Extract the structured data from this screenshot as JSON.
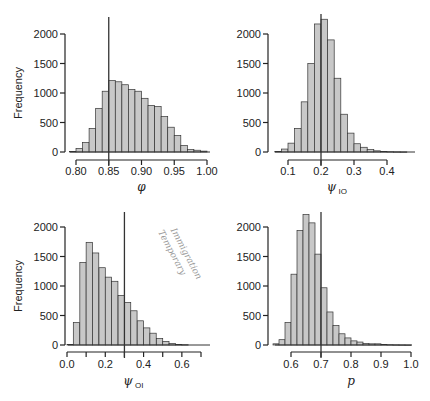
{
  "chart_data": [
    {
      "type": "bar",
      "title": "",
      "xlabel": "φ",
      "ylabel": "Frequency",
      "ylim": [
        0,
        2000
      ],
      "yticks": [
        "0",
        "500",
        "1000",
        "1500",
        "2000"
      ],
      "xticks": [
        "0.80",
        "0.85",
        "0.90",
        "0.95",
        "1.00"
      ],
      "xlim": [
        0.8,
        1.0
      ],
      "bin_width": 0.01,
      "bin_starts": [
        0.79,
        0.8,
        0.81,
        0.82,
        0.83,
        0.84,
        0.85,
        0.86,
        0.87,
        0.88,
        0.89,
        0.9,
        0.91,
        0.92,
        0.93,
        0.94,
        0.95,
        0.96,
        0.97,
        0.98,
        0.99
      ],
      "values": [
        10,
        60,
        160,
        400,
        740,
        1030,
        1210,
        1190,
        1140,
        1060,
        1030,
        910,
        790,
        770,
        600,
        420,
        280,
        110,
        40,
        30,
        15
      ],
      "vline": 0.85,
      "grid": false
    },
    {
      "type": "bar",
      "title": "",
      "xlabel": "ψ",
      "xlabel_sub": "IO",
      "ylabel": "",
      "ylim": [
        0,
        2000
      ],
      "yticks": [
        "0",
        "500",
        "1000",
        "1500",
        "2000"
      ],
      "xticks": [
        "0.1",
        "0.2",
        "0.3",
        "0.4"
      ],
      "xlim": [
        0.1,
        0.4
      ],
      "bin_width": 0.02,
      "bin_starts": [
        0.06,
        0.08,
        0.1,
        0.12,
        0.14,
        0.16,
        0.18,
        0.2,
        0.22,
        0.24,
        0.26,
        0.28,
        0.3,
        0.32,
        0.34,
        0.36,
        0.38,
        0.4,
        0.42,
        0.44
      ],
      "values": [
        10,
        50,
        150,
        400,
        850,
        1500,
        2170,
        2250,
        1900,
        1250,
        640,
        320,
        140,
        80,
        40,
        20,
        10,
        5,
        3,
        2
      ],
      "vline": 0.2,
      "grid": false
    },
    {
      "type": "bar",
      "title": "",
      "xlabel": "ψ",
      "xlabel_sub": "OI",
      "ylabel": "Frequency",
      "ylim": [
        0,
        2000
      ],
      "yticks": [
        "0",
        "500",
        "1000",
        "1500",
        "2000"
      ],
      "xticks": [
        "0.0",
        "0.2",
        "0.4",
        "0.6"
      ],
      "xlim": [
        0.0,
        0.7
      ],
      "bin_width": 0.033,
      "bin_starts": [
        0.0,
        0.033,
        0.067,
        0.1,
        0.133,
        0.167,
        0.2,
        0.233,
        0.267,
        0.3,
        0.333,
        0.367,
        0.4,
        0.433,
        0.467,
        0.5,
        0.533,
        0.567,
        0.6
      ],
      "values": [
        10,
        380,
        1400,
        1740,
        1560,
        1310,
        1150,
        1080,
        840,
        720,
        580,
        410,
        290,
        200,
        110,
        60,
        25,
        10,
        5
      ],
      "vline": 0.3,
      "annotation": "Temporary Immigration",
      "grid": false
    },
    {
      "type": "bar",
      "title": "",
      "xlabel": "p",
      "ylabel": "",
      "ylim": [
        0,
        2000
      ],
      "yticks": [
        "0",
        "500",
        "1000",
        "1500",
        "2000"
      ],
      "xticks": [
        "0.6",
        "0.7",
        "0.8",
        "0.9",
        "1.0"
      ],
      "xlim": [
        0.6,
        1.0
      ],
      "bin_width": 0.02,
      "bin_starts": [
        0.54,
        0.56,
        0.58,
        0.6,
        0.62,
        0.64,
        0.66,
        0.68,
        0.7,
        0.72,
        0.74,
        0.76,
        0.78,
        0.8,
        0.82,
        0.84,
        0.86,
        0.88,
        0.9,
        0.92,
        0.94,
        0.96,
        0.98
      ],
      "values": [
        20,
        90,
        380,
        1200,
        1940,
        2210,
        2070,
        1540,
        970,
        560,
        330,
        190,
        120,
        70,
        50,
        25,
        20,
        20,
        10,
        5,
        3,
        2,
        1
      ],
      "vline": 0.7,
      "grid": false
    }
  ]
}
